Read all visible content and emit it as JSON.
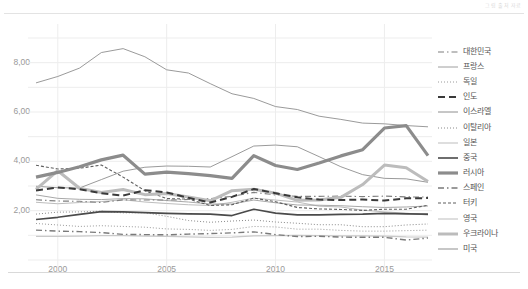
{
  "header": {
    "note": "그림 출처 자료"
  },
  "axes": {
    "y_ticks": [
      "8,00",
      "6,00",
      "4,00",
      "2,00"
    ],
    "y_tick_values": [
      8,
      6,
      4,
      2
    ],
    "x_ticks": [
      "2000",
      "2005",
      "2010",
      "2015"
    ],
    "x_tick_values": [
      2000,
      2005,
      2010,
      2015
    ],
    "ylim": [
      0,
      9
    ],
    "xlim": [
      1999,
      2017
    ]
  },
  "colors": {
    "korea": "#7f7f7f",
    "france": "#9e9e9e",
    "germany": "#9a9a9a",
    "india": "#3a3a3a",
    "israel": "#8e8e8e",
    "italy": "#8a8a8a",
    "japan": "#c9c9c9",
    "china": "#4a4a4a",
    "russia": "#8c8c8c",
    "spain": "#7a7a7a",
    "turkey": "#5f5f5f",
    "uk": "#bdbdbd",
    "ukraine": "#bcbcbc",
    "usa": "#8f8f8f",
    "grid": "#ededed",
    "axis_text": "#9a9a9a"
  },
  "chart_data": {
    "type": "line",
    "title": "",
    "xlabel": "",
    "ylabel": "",
    "ylim": [
      0,
      9
    ],
    "xlim": [
      1999,
      2017
    ],
    "grid": true,
    "legend_position": "right",
    "x": [
      1999,
      2000,
      2001,
      2002,
      2003,
      2004,
      2005,
      2006,
      2007,
      2008,
      2009,
      2010,
      2011,
      2012,
      2013,
      2014,
      2015,
      2016,
      2017
    ],
    "series": [
      {
        "name": "대한민국",
        "key": "korea",
        "style": "dashdot",
        "width": 1.1,
        "color": "#7f7f7f",
        "values": [
          2.44,
          2.39,
          2.38,
          2.33,
          2.44,
          2.43,
          2.43,
          2.45,
          2.49,
          2.58,
          2.74,
          2.64,
          2.58,
          2.58,
          2.59,
          2.57,
          2.59,
          2.56,
          2.55
        ]
      },
      {
        "name": "프랑스",
        "key": "france",
        "style": "solid",
        "width": 0.9,
        "color": "#9e9e9e",
        "values": [
          2.64,
          2.5,
          2.46,
          2.45,
          2.49,
          2.48,
          2.41,
          2.35,
          2.27,
          2.27,
          2.43,
          2.32,
          2.23,
          2.22,
          2.2,
          2.16,
          2.13,
          2.15,
          2.19
        ]
      },
      {
        "name": "독일",
        "key": "germany",
        "style": "dotted",
        "width": 1.0,
        "color": "#9a9a9a",
        "values": [
          1.48,
          1.42,
          1.36,
          1.39,
          1.36,
          1.33,
          1.26,
          1.24,
          1.2,
          1.24,
          1.36,
          1.34,
          1.25,
          1.25,
          1.2,
          1.17,
          1.17,
          1.19,
          1.21
        ]
      },
      {
        "name": "인도",
        "key": "india",
        "style": "dashed-thick",
        "width": 2.0,
        "color": "#3a3a3a",
        "values": [
          2.82,
          2.94,
          2.87,
          2.71,
          2.61,
          2.83,
          2.74,
          2.52,
          2.33,
          2.56,
          2.88,
          2.71,
          2.54,
          2.45,
          2.43,
          2.45,
          2.41,
          2.5,
          2.51
        ]
      },
      {
        "name": "이스라엘",
        "key": "israel",
        "style": "solid",
        "width": 0.9,
        "color": "#8e8e8e",
        "values": [
          7.18,
          7.44,
          7.78,
          8.41,
          8.57,
          8.24,
          7.71,
          7.58,
          7.15,
          6.74,
          6.55,
          6.22,
          6.1,
          5.83,
          5.7,
          5.55,
          5.52,
          5.45,
          5.4
        ]
      },
      {
        "name": "이탈리아",
        "key": "italy",
        "style": "dotted",
        "width": 1.0,
        "color": "#8a8a8a",
        "values": [
          1.86,
          1.94,
          1.95,
          1.98,
          1.91,
          1.92,
          1.77,
          1.6,
          1.53,
          1.58,
          1.62,
          1.54,
          1.49,
          1.43,
          1.43,
          1.35,
          1.35,
          1.42,
          1.46
        ]
      },
      {
        "name": "일본",
        "key": "japan",
        "style": "solid-light",
        "width": 1.2,
        "color": "#c9c9c9",
        "values": [
          0.96,
          0.96,
          0.97,
          0.99,
          0.99,
          0.97,
          0.96,
          0.94,
          0.92,
          0.93,
          0.98,
          0.99,
          1.0,
          0.99,
          0.98,
          0.98,
          0.97,
          0.94,
          0.93
        ]
      },
      {
        "name": "중국",
        "key": "china",
        "style": "solid-thick",
        "width": 1.6,
        "color": "#4a4a4a",
        "values": [
          1.64,
          1.73,
          1.85,
          1.96,
          1.95,
          1.92,
          1.89,
          1.87,
          1.86,
          1.8,
          2.06,
          1.9,
          1.83,
          1.83,
          1.85,
          1.86,
          1.89,
          1.87,
          1.86
        ]
      },
      {
        "name": "러시아",
        "key": "russia",
        "style": "solid-xthick",
        "width": 3.2,
        "color": "#8c8c8c",
        "values": [
          3.36,
          3.55,
          3.78,
          4.06,
          4.25,
          3.48,
          3.56,
          3.5,
          3.42,
          3.31,
          4.23,
          3.83,
          3.67,
          3.93,
          4.22,
          4.47,
          5.35,
          5.45,
          4.23
        ]
      },
      {
        "name": "스페인",
        "key": "spain",
        "style": "dashdot-thick",
        "width": 1.4,
        "color": "#7a7a7a",
        "values": [
          1.21,
          1.17,
          1.15,
          1.11,
          1.04,
          1.03,
          1.02,
          1.05,
          1.07,
          1.1,
          1.14,
          1.03,
          0.95,
          0.96,
          0.93,
          0.92,
          0.92,
          0.81,
          0.89
        ]
      },
      {
        "name": "터키",
        "key": "turkey",
        "style": "dashed-fine",
        "width": 1.1,
        "color": "#5f5f5f",
        "values": [
          3.84,
          3.69,
          3.72,
          3.85,
          3.36,
          2.81,
          2.49,
          2.47,
          2.21,
          2.24,
          2.51,
          2.36,
          2.13,
          2.07,
          2.05,
          2.01,
          2.06,
          2.06,
          2.22
        ]
      },
      {
        "name": "영국",
        "key": "uk",
        "style": "solid-light",
        "width": 1.0,
        "color": "#bdbdbd",
        "values": [
          2.34,
          2.28,
          2.33,
          2.37,
          2.44,
          2.35,
          2.29,
          2.24,
          2.21,
          2.34,
          2.51,
          2.43,
          2.35,
          2.18,
          2.15,
          2.02,
          1.95,
          1.9,
          1.82
        ]
      },
      {
        "name": "우크라이나",
        "key": "ukraine",
        "style": "solid-xthick-light",
        "width": 3.0,
        "color": "#bcbcbc",
        "values": [
          2.86,
          3.62,
          2.91,
          2.74,
          2.86,
          2.65,
          2.7,
          2.55,
          2.4,
          2.81,
          2.87,
          2.71,
          2.42,
          2.43,
          2.54,
          3.06,
          3.85,
          3.74,
          3.18
        ]
      },
      {
        "name": "미국",
        "key": "usa",
        "style": "solid",
        "width": 0.9,
        "color": "#8f8f8f",
        "values": [
          2.99,
          2.93,
          2.92,
          3.26,
          3.6,
          3.76,
          3.81,
          3.8,
          3.77,
          4.19,
          4.62,
          4.66,
          4.59,
          4.19,
          3.78,
          3.46,
          3.31,
          3.29,
          3.15
        ]
      }
    ]
  },
  "legend": {
    "items": [
      {
        "label": "대한민국",
        "key": "korea"
      },
      {
        "label": "프랑스",
        "key": "france"
      },
      {
        "label": "독일",
        "key": "germany"
      },
      {
        "label": "인도",
        "key": "india"
      },
      {
        "label": "이스라엘",
        "key": "israel"
      },
      {
        "label": "이탈리아",
        "key": "italy"
      },
      {
        "label": "일본",
        "key": "japan"
      },
      {
        "label": "중국",
        "key": "china"
      },
      {
        "label": "러시아",
        "key": "russia"
      },
      {
        "label": "스페인",
        "key": "spain"
      },
      {
        "label": "터키",
        "key": "turkey"
      },
      {
        "label": "영국",
        "key": "uk"
      },
      {
        "label": "우크라이나",
        "key": "ukraine"
      },
      {
        "label": "미국",
        "key": "usa"
      }
    ]
  }
}
